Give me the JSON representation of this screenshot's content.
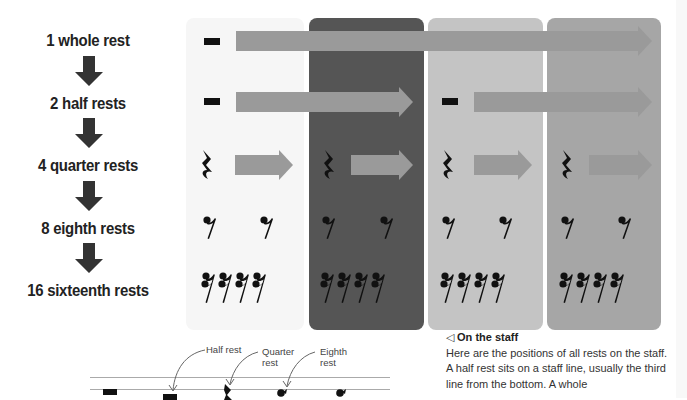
{
  "rows": [
    {
      "label": "1 whole rest",
      "count": 1,
      "rest": "whole"
    },
    {
      "label": "2 half rests",
      "count": 2,
      "rest": "half"
    },
    {
      "label": "4 quarter rests",
      "count": 4,
      "rest": "quarter"
    },
    {
      "label": "8 eighth rests",
      "count": 8,
      "rest": "eighth"
    },
    {
      "label": "16 sixteenth rests",
      "count": 16,
      "rest": "sixteenth"
    }
  ],
  "panels": [
    {
      "shade": "#f6f6f6"
    },
    {
      "shade": "#555555"
    },
    {
      "shade": "#c4c4c4"
    },
    {
      "shade": "#a6a6a6"
    }
  ],
  "staff": {
    "annotations": [
      "Half rest",
      "Quarter rest",
      "Eighth rest"
    ],
    "annotation_lines": {
      "half": "Half rest",
      "quarter_1": "Quarter",
      "quarter_2": "rest",
      "eighth_1": "Eighth",
      "eighth_2": "rest"
    }
  },
  "caption": {
    "marker": "◁",
    "title": "On the staff",
    "body": "Here are the positions of all rests on the staff. A half rest sits on a staff line, usually the third line from the bottom. A whole"
  },
  "colors": {
    "arrow_gray": "#9a9a9a",
    "down_arrow": "#333333",
    "symbol": "#111111"
  }
}
